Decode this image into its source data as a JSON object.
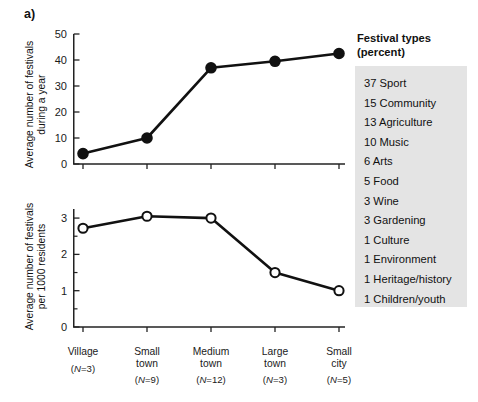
{
  "panels": {
    "a": {
      "letter": "a)"
    },
    "b": {
      "letter": "b)",
      "heading": "Festival types\n (percent)"
    }
  },
  "chart_data": [
    {
      "type": "line",
      "id": "festivals-per-year",
      "panel": "a",
      "title": "",
      "ylabel": "Average number of festivals\nduring a year",
      "xlabel": "",
      "categories": [
        "Village",
        "Small town",
        "Medium town",
        "Large town",
        "Small city"
      ],
      "category_n": [
        "(N=3)",
        "(N=9)",
        "(N=12)",
        "(N=3)",
        "(N=5)"
      ],
      "values": [
        4,
        10,
        37,
        39.5,
        42.5
      ],
      "ylim": [
        0,
        50
      ],
      "yticks": [
        0,
        10,
        20,
        30,
        40,
        50
      ],
      "ytick_labels": [
        "0",
        "10",
        "20",
        "30",
        "40",
        "50"
      ],
      "marker": "filled-circle",
      "grid": false,
      "legend": "none"
    },
    {
      "type": "line",
      "id": "festivals-per-1000-residents",
      "panel": "a",
      "title": "",
      "ylabel": "Average number of festivals\nper 1000 residents",
      "xlabel": "",
      "categories": [
        "Village",
        "Small town",
        "Medium town",
        "Large town",
        "Small city"
      ],
      "category_n": [
        "(N=3)",
        "(N=9)",
        "(N=12)",
        "(N=3)",
        "(N=5)"
      ],
      "values": [
        2.72,
        3.05,
        3.0,
        1.5,
        1.0
      ],
      "ylim": [
        0,
        3.25
      ],
      "yticks": [
        0,
        1,
        2,
        3
      ],
      "ytick_labels": [
        "0",
        "1",
        "2",
        "3"
      ],
      "minor_yticks": [
        0.5,
        1.5,
        2.5
      ],
      "marker": "open-circle",
      "grid": false,
      "legend": "none"
    },
    {
      "type": "table",
      "id": "festival-types-percent",
      "panel": "b",
      "title": "Festival types (percent)",
      "columns": [
        "percent",
        "type"
      ],
      "rows": [
        {
          "percent": "37",
          "type": "Sport"
        },
        {
          "percent": "15",
          "type": "Community"
        },
        {
          "percent": "13",
          "type": "Agriculture"
        },
        {
          "percent": "10",
          "type": "Music"
        },
        {
          "percent": "6",
          "type": "Arts"
        },
        {
          "percent": "5",
          "type": "Food"
        },
        {
          "percent": "3",
          "type": "Wine"
        },
        {
          "percent": "3",
          "type": "Gardening"
        },
        {
          "percent": "1",
          "type": "Culture"
        },
        {
          "percent": "1",
          "type": "Environment"
        },
        {
          "percent": "1",
          "type": "Heritage/history"
        },
        {
          "percent": "1",
          "type": "Children/youth"
        }
      ]
    }
  ],
  "colors": {
    "axis": "#222222",
    "line": "#111111",
    "marker_fill_top": "#111111",
    "marker_fill_bottom": "#ffffff",
    "list_background": "#e4e4e4",
    "text": "#1a1a1a"
  }
}
